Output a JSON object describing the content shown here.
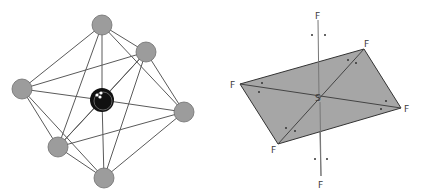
{
  "figure": {
    "left": {
      "title": "octahedral molecule ball-and-stick model",
      "central_atom_color": "#111111",
      "ligand_color": "#9a9a9a",
      "bond_color": "#555555",
      "atoms": [
        {
          "id": "top",
          "x": 102,
          "y": 25
        },
        {
          "id": "upper-right",
          "x": 146,
          "y": 52
        },
        {
          "id": "left",
          "x": 22,
          "y": 89
        },
        {
          "id": "right",
          "x": 184,
          "y": 112
        },
        {
          "id": "lower-left",
          "x": 58,
          "y": 147
        },
        {
          "id": "bottom",
          "x": 104,
          "y": 178
        }
      ],
      "center": {
        "x": 102,
        "y": 100
      }
    },
    "right": {
      "title": "SF6 octahedral geometry",
      "central_label": "S",
      "ligand_label": "F",
      "plane_color": "#a6a6a6",
      "labels": [
        {
          "text": "F",
          "x": 315,
          "y": 19
        },
        {
          "text": "F",
          "x": 364,
          "y": 47
        },
        {
          "text": "F",
          "x": 230,
          "y": 88
        },
        {
          "text": "F",
          "x": 404,
          "y": 112
        },
        {
          "text": "F",
          "x": 271,
          "y": 153
        },
        {
          "text": "F",
          "x": 318,
          "y": 188
        },
        {
          "text": "S",
          "x": 315,
          "y": 101
        }
      ]
    }
  }
}
